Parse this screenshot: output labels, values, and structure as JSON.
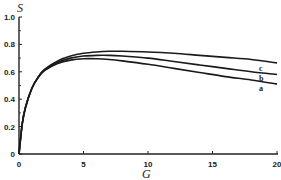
{
  "chart_data": {
    "type": "line",
    "title": "",
    "xlabel": "G",
    "ylabel": "S",
    "xlim": [
      0,
      20
    ],
    "ylim": [
      0,
      1.0
    ],
    "xticks": [
      "0",
      "5",
      "10",
      "15",
      "20"
    ],
    "yticks": [
      "0",
      "0.2",
      "0.4",
      "0.6",
      "0.8",
      "1.0"
    ],
    "grid": false,
    "legend": "inline labels at right end of curves",
    "x": [
      0,
      0.25,
      0.5,
      1,
      1.5,
      2,
      3,
      4,
      5,
      6,
      7,
      8,
      10,
      12,
      14,
      16,
      18,
      20
    ],
    "series": [
      {
        "name": "a",
        "values": [
          0,
          0.22,
          0.34,
          0.48,
          0.56,
          0.61,
          0.66,
          0.685,
          0.695,
          0.695,
          0.69,
          0.68,
          0.655,
          0.625,
          0.595,
          0.565,
          0.54,
          0.51
        ]
      },
      {
        "name": "b",
        "values": [
          0,
          0.22,
          0.34,
          0.48,
          0.56,
          0.615,
          0.67,
          0.7,
          0.715,
          0.72,
          0.72,
          0.715,
          0.7,
          0.675,
          0.65,
          0.625,
          0.6,
          0.58
        ]
      },
      {
        "name": "c",
        "values": [
          0,
          0.22,
          0.34,
          0.48,
          0.565,
          0.62,
          0.68,
          0.715,
          0.735,
          0.745,
          0.75,
          0.75,
          0.745,
          0.735,
          0.72,
          0.705,
          0.69,
          0.665
        ]
      }
    ]
  },
  "labels": {
    "y_axis": "S",
    "x_axis": "G",
    "curve_a": "a",
    "curve_b": "b",
    "curve_c": "c"
  }
}
